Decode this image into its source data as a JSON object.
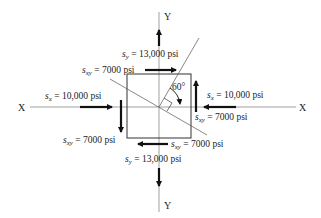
{
  "diagram": {
    "type": "stress-element",
    "axes": {
      "x_left": "X",
      "x_right": "X",
      "y_top": "Y",
      "y_bottom": "Y"
    },
    "angle_label": "60°",
    "stresses": {
      "sy_top": {
        "symbol": "s",
        "sub": "y",
        "eq": " = ",
        "value": "13,000 psi"
      },
      "sy_bottom": {
        "symbol": "s",
        "sub": "y",
        "eq": " = ",
        "value": "13,000 psi"
      },
      "sx_left": {
        "symbol": "s",
        "sub": "x",
        "eq": " = ",
        "value": "10,000 psi"
      },
      "sx_right": {
        "symbol": "s",
        "sub": "x",
        "eq": " = ",
        "value": "10,000 psi"
      },
      "sxy_top": {
        "symbol": "s",
        "sub": "xy",
        "eq": " = ",
        "value": "7000 psi"
      },
      "sxy_right": {
        "symbol": "s",
        "sub": "xy",
        "eq": " = ",
        "value": "7000 psi"
      },
      "sxy_left": {
        "symbol": "s",
        "sub": "xy",
        "eq": " = ",
        "value": "7000 psi"
      },
      "sxy_bottom": {
        "symbol": "s",
        "sub": "xy",
        "eq": " = ",
        "value": "7000 psi"
      }
    },
    "colors": {
      "line": "#222222",
      "axis": "#888888"
    }
  }
}
